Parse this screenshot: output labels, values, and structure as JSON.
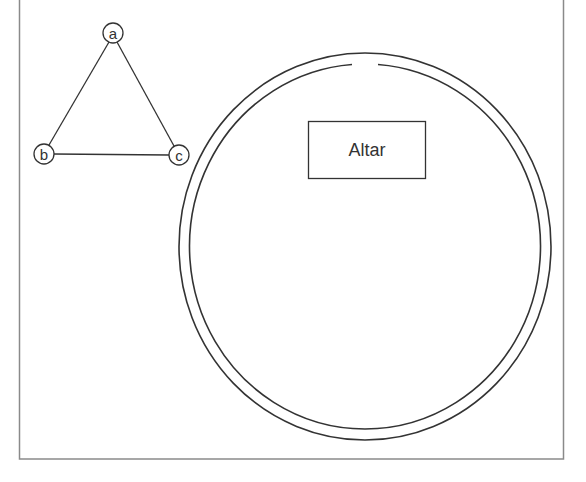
{
  "diagram": {
    "frame": {
      "x": 19,
      "y": -10,
      "width": 544,
      "height": 469,
      "stroke": "#8a8a8a"
    },
    "graph": {
      "nodes": [
        {
          "id": "a",
          "label": "a",
          "cx": 113,
          "cy": 33,
          "r": 10
        },
        {
          "id": "b",
          "label": "b",
          "cx": 44,
          "cy": 154,
          "r": 10
        },
        {
          "id": "c",
          "label": "c",
          "cx": 179,
          "cy": 155,
          "r": 10
        }
      ],
      "edges": [
        {
          "from": "a",
          "to": "b"
        },
        {
          "from": "a",
          "to": "c"
        },
        {
          "from": "b",
          "to": "c"
        }
      ]
    },
    "circle": {
      "outer": {
        "cx": 365,
        "cy": 246.5,
        "rx": 186,
        "ry": 193.5
      },
      "inner": {
        "cx": 365,
        "cy": 246.5,
        "rx": 175.5,
        "ry": 182.5,
        "gap_x": [
          352,
          378
        ]
      }
    },
    "altar": {
      "label": "Altar",
      "x": 308,
      "y": 121,
      "width": 117,
      "height": 58
    },
    "stroke_color": "#333333"
  }
}
